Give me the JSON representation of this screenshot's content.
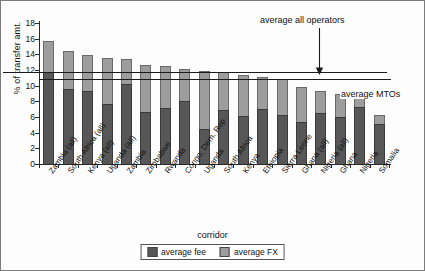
{
  "chart_data": {
    "type": "bar",
    "stacked": true,
    "title": "",
    "xlabel": "corridor",
    "ylabel": "% of transfer amt.",
    "ylim": [
      0,
      18
    ],
    "yticks": [
      0,
      2,
      4,
      6,
      8,
      10,
      12,
      14,
      16,
      18
    ],
    "grid": false,
    "legend_position": "bottom-center",
    "categories": [
      "Zambia (all)",
      "South Africa (all)",
      "Kenya (all)",
      "Uganda (all)",
      "Zambia",
      "Zimbabwe",
      "Rwanda",
      "Congo, Dem. Rep.",
      "Uganda",
      "South Africa",
      "Kenya",
      "Ethiopia",
      "Sierra Leone",
      "Ghana (all)",
      "Nigeria (all)",
      "Ghana",
      "Nigeria",
      "Somalia"
    ],
    "series": [
      {
        "name": "average fee",
        "color": "#575757",
        "values": [
          11.7,
          9.6,
          9.3,
          7.6,
          10.2,
          6.6,
          7.2,
          8.1,
          4.5,
          6.9,
          6.1,
          7.0,
          6.2,
          5.4,
          6.5,
          6.0,
          7.3,
          5.1
        ]
      },
      {
        "name": "average FX",
        "color": "#9d9d9d",
        "values": [
          4.0,
          4.8,
          4.6,
          5.9,
          3.2,
          6.1,
          5.3,
          4.0,
          7.4,
          4.8,
          5.3,
          4.1,
          4.6,
          4.4,
          2.8,
          2.9,
          1.4,
          1.2
        ]
      }
    ],
    "totals": [
      15.7,
      14.4,
      13.9,
      13.5,
      13.4,
      12.7,
      12.5,
      12.1,
      11.9,
      11.7,
      11.4,
      11.1,
      10.8,
      9.8,
      9.3,
      8.9,
      8.7,
      6.3
    ],
    "reference_lines": [
      {
        "id": "average-all-operators",
        "label": "average all operators",
        "value": 11.7
      },
      {
        "id": "average-mtos",
        "label": "average MTOs",
        "value": 10.8
      }
    ],
    "annotations": [
      {
        "id": "arrow-to-average-all-operators",
        "text": "average all operators",
        "points_to": "average-all-operators"
      },
      {
        "id": "label-average-mtos",
        "text": "average MTOs",
        "points_to": "average-mtos"
      }
    ]
  },
  "legend": {
    "items": [
      {
        "label": "average fee",
        "swatch": "dark-gray-swatch"
      },
      {
        "label": "average FX",
        "swatch": "light-gray-swatch"
      }
    ]
  }
}
